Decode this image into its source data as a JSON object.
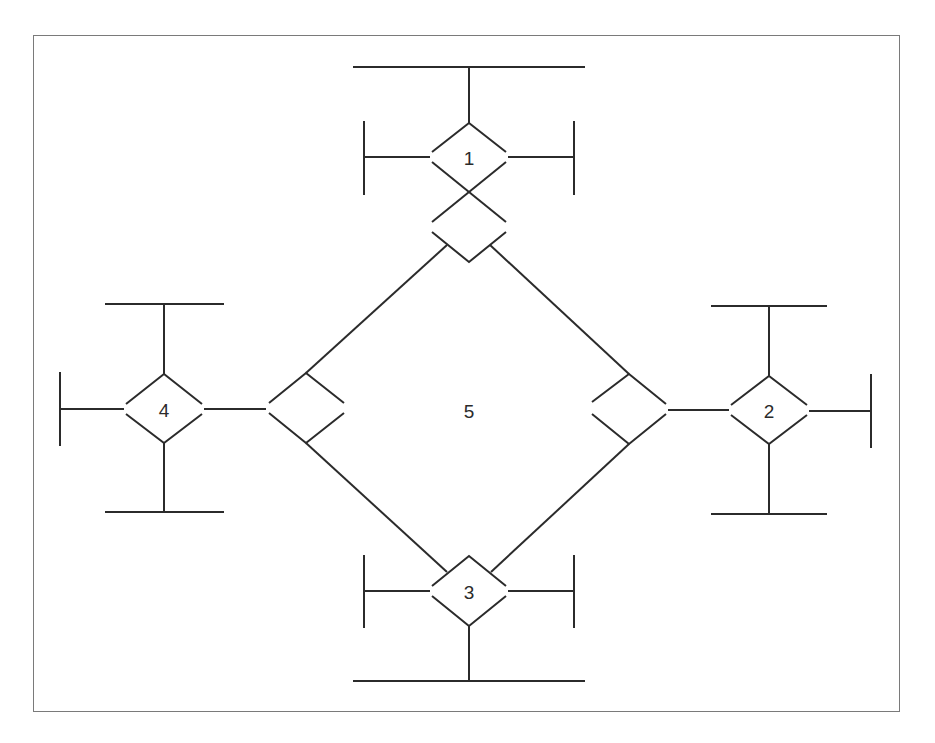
{
  "diagram": {
    "title": "",
    "colors": {
      "line": "#2b2b2b",
      "frame": "#7a7a7a",
      "background": "#ffffff"
    },
    "nodes": [
      {
        "id": "1",
        "label": "1",
        "cx": 469,
        "cy": 157,
        "hw": 37,
        "hh": 34,
        "gap": 5,
        "role": "junction-top"
      },
      {
        "id": "2",
        "label": "2",
        "cx": 769,
        "cy": 410,
        "hw": 38,
        "hh": 34,
        "gap": 4,
        "role": "junction-right"
      },
      {
        "id": "3",
        "label": "3",
        "cx": 469,
        "cy": 591,
        "hw": 37,
        "hh": 35,
        "gap": 5,
        "role": "junction-bottom"
      },
      {
        "id": "4",
        "label": "4",
        "cx": 164,
        "cy": 409,
        "hw": 38,
        "hh": 35,
        "gap": 4,
        "role": "junction-left"
      },
      {
        "id": "5",
        "label": "5",
        "cx": 469,
        "cy": 410,
        "role": "central-region"
      }
    ],
    "labels": {
      "n1": "1",
      "n2": "2",
      "n3": "3",
      "n4": "4",
      "n5": "5"
    }
  }
}
